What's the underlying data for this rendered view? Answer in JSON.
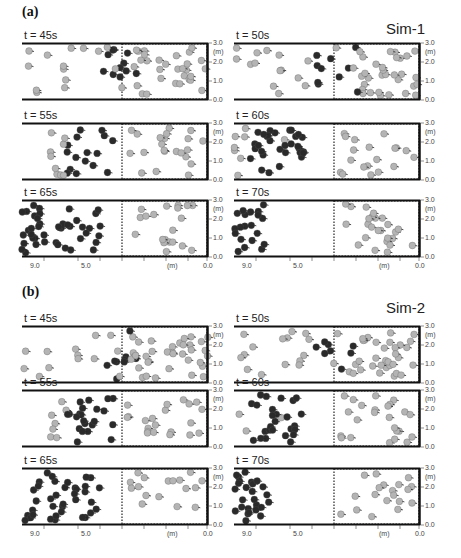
{
  "figure": {
    "parts": [
      {
        "label": "(a)",
        "sim": "Sim-1",
        "panels": [
          {
            "time": "t = 45s",
            "dark_front": 0.52,
            "dark_spread": 0.1,
            "light_start": 0.3,
            "phase": "mix"
          },
          {
            "time": "t = 50s",
            "dark_front": 0.55,
            "dark_spread": 0.12,
            "light_start": 0.2,
            "phase": "mix"
          },
          {
            "time": "t = 55s",
            "dark_front": 0.42,
            "dark_spread": 0.18,
            "light_start": 0.4,
            "phase": "cluster"
          },
          {
            "time": "t = 60s",
            "dark_front": 0.3,
            "dark_spread": 0.22,
            "light_start": 0.55,
            "phase": "cluster"
          },
          {
            "time": "t = 65s",
            "dark_front": 0.12,
            "dark_spread": 0.3,
            "light_start": 1.0,
            "phase": "separate"
          },
          {
            "time": "t = 70s",
            "dark_front": 0.05,
            "dark_spread": 0.15,
            "light_start": 1.0,
            "phase": "separate"
          }
        ]
      },
      {
        "label": "(b)",
        "sim": "Sim-2",
        "panels": [
          {
            "time": "t = 45s",
            "dark_front": 0.52,
            "dark_spread": 0.1,
            "light_start": 0.3,
            "phase": "mix"
          },
          {
            "time": "t = 50s",
            "dark_front": 0.55,
            "dark_spread": 0.12,
            "light_start": 0.2,
            "phase": "mix"
          },
          {
            "time": "t = 55s",
            "dark_front": 0.42,
            "dark_spread": 0.18,
            "light_start": 0.4,
            "phase": "cluster"
          },
          {
            "time": "t = 60s",
            "dark_front": 0.3,
            "dark_spread": 0.22,
            "light_start": 0.55,
            "phase": "cluster"
          },
          {
            "time": "t = 65s",
            "dark_front": 0.12,
            "dark_spread": 0.3,
            "light_start": 1.0,
            "phase": "separate"
          },
          {
            "time": "t = 70s",
            "dark_front": 0.05,
            "dark_spread": 0.15,
            "light_start": 1.0,
            "phase": "separate"
          }
        ]
      }
    ],
    "y_axis": {
      "ticks": [
        "3.0",
        "(m)",
        "2.0",
        "1.0",
        "0.0"
      ]
    },
    "x_axis": {
      "ticks": [
        "9.0",
        "5.0",
        "(m)",
        "0.0"
      ]
    },
    "colors": {
      "dark_agent": "#2a2a2a",
      "light_agent": "#b4b4b4",
      "border": "#111111"
    }
  }
}
